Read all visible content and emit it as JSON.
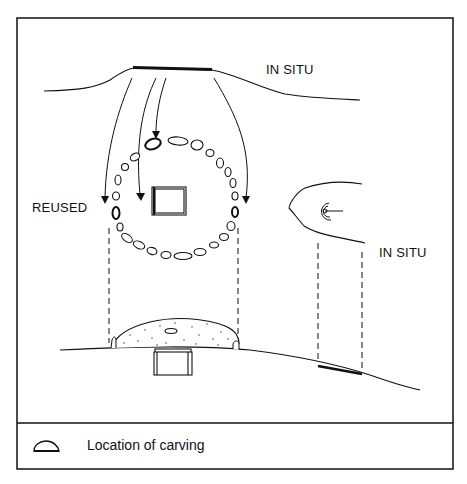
{
  "labels": {
    "top_in_situ": "IN SITU",
    "reused": "REUSED",
    "right_in_situ": "IN SITU"
  },
  "legend": {
    "icon": "carving-location-icon",
    "text": "Location of carving"
  },
  "colors": {
    "line": "#111111",
    "background": "#ffffff"
  }
}
